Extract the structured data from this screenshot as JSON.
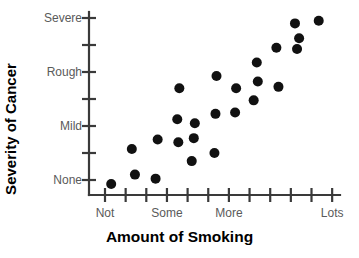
{
  "chart_data": {
    "type": "scatter",
    "title": "",
    "xlabel": "Amount of Smoking",
    "ylabel": "Severity of Cancer",
    "xtick_labels": [
      "Not",
      "Some",
      "More",
      "Lots"
    ],
    "ytick_labels": [
      "Severe",
      "Rough",
      "Mild",
      "None"
    ],
    "x_tick_count": 12,
    "y_tick_count": 8,
    "xlim": [
      0,
      11
    ],
    "ylim": [
      0,
      7
    ],
    "grid": false,
    "legend": false,
    "marker": "filled-circle",
    "marker_color": "#111111",
    "axis_color": "#3a3a3a",
    "tick_label_color": "#5a5a5a",
    "xtick_label_positions": [
      0,
      3,
      6,
      11
    ],
    "ytick_label_positions": [
      7,
      5,
      3,
      1
    ],
    "points": [
      {
        "x": 0.3,
        "y": 0.85
      },
      {
        "x": 1.3,
        "y": 2.15
      },
      {
        "x": 1.45,
        "y": 1.2
      },
      {
        "x": 2.45,
        "y": 1.05
      },
      {
        "x": 2.55,
        "y": 2.5
      },
      {
        "x": 3.5,
        "y": 3.25
      },
      {
        "x": 3.55,
        "y": 2.4
      },
      {
        "x": 3.6,
        "y": 4.4
      },
      {
        "x": 4.2,
        "y": 1.7
      },
      {
        "x": 4.3,
        "y": 2.55
      },
      {
        "x": 4.35,
        "y": 3.1
      },
      {
        "x": 5.3,
        "y": 2.0
      },
      {
        "x": 5.35,
        "y": 3.45
      },
      {
        "x": 5.4,
        "y": 4.85
      },
      {
        "x": 6.3,
        "y": 3.5
      },
      {
        "x": 6.35,
        "y": 4.4
      },
      {
        "x": 7.2,
        "y": 3.95
      },
      {
        "x": 7.35,
        "y": 5.35
      },
      {
        "x": 7.4,
        "y": 4.65
      },
      {
        "x": 8.3,
        "y": 5.9
      },
      {
        "x": 8.4,
        "y": 4.45
      },
      {
        "x": 9.2,
        "y": 6.8
      },
      {
        "x": 9.3,
        "y": 5.85
      },
      {
        "x": 9.4,
        "y": 6.25
      },
      {
        "x": 10.35,
        "y": 6.9
      }
    ]
  },
  "axes": {
    "x_title": "Amount of Smoking",
    "y_title": "Severity of Cancer"
  }
}
